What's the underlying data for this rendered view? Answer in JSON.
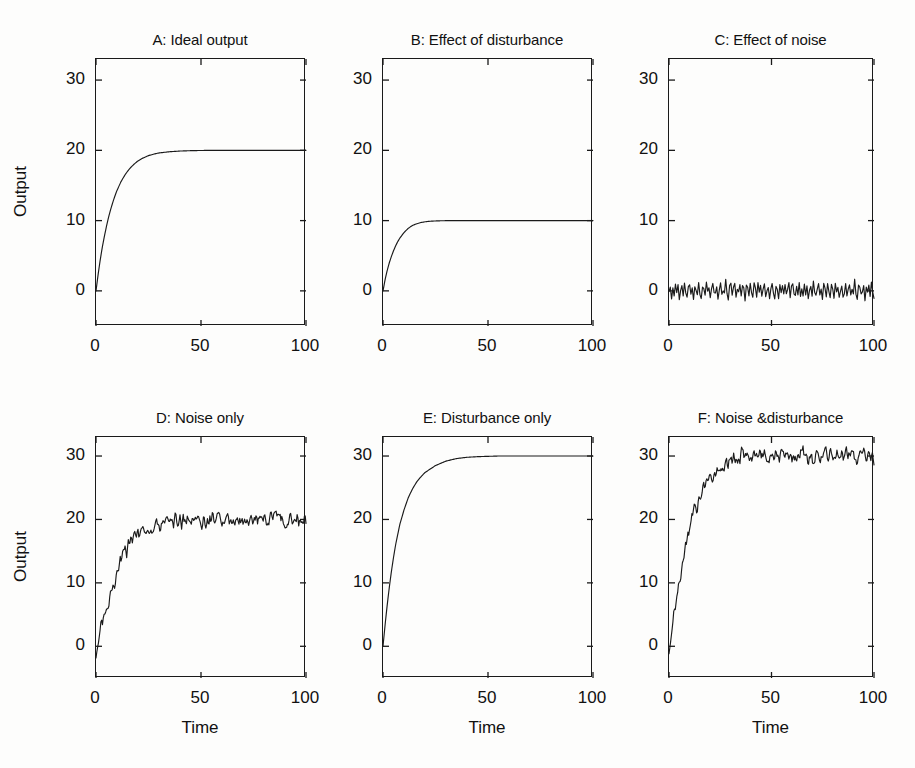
{
  "figure": {
    "background_color": "#fdfdfc",
    "line_color": "#1a1a1a",
    "axis_color": "#1a1a1a",
    "rows": 2,
    "cols": 3
  },
  "axis_common": {
    "xlabel": "Time",
    "ylabel": "Output",
    "xticks": [
      "0",
      "50",
      "100"
    ],
    "xtick_values": [
      0,
      50,
      100
    ],
    "yticks": [
      "0",
      "10",
      "20",
      "30"
    ],
    "ytick_values": [
      0,
      10,
      20,
      30
    ],
    "xlim": [
      0,
      100
    ],
    "ylim": [
      -5,
      33
    ],
    "grid": false,
    "box": true,
    "tick_direction": "in"
  },
  "panels": [
    {
      "id": "A",
      "title": "A: Ideal output",
      "show_ylabel": true,
      "show_xlabel": false,
      "row": 0,
      "col": 0
    },
    {
      "id": "B",
      "title": "B: Effect of disturbance",
      "show_ylabel": false,
      "show_xlabel": false,
      "row": 0,
      "col": 1
    },
    {
      "id": "C",
      "title": "C: Effect of noise",
      "show_ylabel": false,
      "show_xlabel": false,
      "row": 0,
      "col": 2
    },
    {
      "id": "D",
      "title": "D: Noise only",
      "show_ylabel": true,
      "show_xlabel": true,
      "row": 1,
      "col": 0
    },
    {
      "id": "E",
      "title": "E: Disturbance only",
      "show_ylabel": false,
      "show_xlabel": true,
      "row": 1,
      "col": 1
    },
    {
      "id": "F",
      "title": "F: Noise &disturbance",
      "show_ylabel": false,
      "show_xlabel": true,
      "row": 1,
      "col": 2
    }
  ],
  "chart_data": [
    {
      "type": "line",
      "panel": "A",
      "title": "A: Ideal output",
      "xlabel": "",
      "ylabel": "Output",
      "xlim": [
        0,
        100
      ],
      "ylim": [
        -5,
        33
      ],
      "xticks": [
        0,
        50,
        100
      ],
      "yticks": [
        0,
        10,
        20,
        30
      ],
      "grid": false,
      "legend": null,
      "series": [
        {
          "name": "ideal output",
          "description": "smooth first-order step response rising from 0 to steady state 20, time constant approx 10",
          "x": [
            0,
            1,
            2,
            3,
            4,
            5,
            6,
            7,
            8,
            9,
            10,
            12,
            14,
            16,
            18,
            20,
            22,
            25,
            28,
            30,
            35,
            40,
            45,
            50,
            55,
            60,
            65,
            70,
            75,
            80,
            85,
            90,
            95,
            100
          ],
          "y": [
            0,
            2.3,
            4.4,
            6.2,
            7.8,
            9.2,
            10.5,
            11.6,
            12.6,
            13.5,
            14.3,
            15.6,
            16.6,
            17.4,
            18.0,
            18.5,
            18.85,
            19.25,
            19.5,
            19.63,
            19.8,
            19.9,
            19.95,
            19.98,
            20,
            20,
            20,
            20,
            20,
            20,
            20,
            20,
            20,
            20
          ]
        }
      ]
    },
    {
      "type": "line",
      "panel": "B",
      "title": "B: Effect of disturbance",
      "xlabel": "",
      "ylabel": "",
      "xlim": [
        0,
        100
      ],
      "ylim": [
        -5,
        33
      ],
      "xticks": [
        0,
        50,
        100
      ],
      "yticks": [
        0,
        10,
        20,
        30
      ],
      "grid": false,
      "legend": null,
      "series": [
        {
          "name": "disturbance response",
          "description": "smooth first-order step response rising from 0 to steady state 10, settles by t=35",
          "x": [
            0,
            1,
            2,
            3,
            4,
            5,
            6,
            7,
            8,
            9,
            10,
            12,
            14,
            16,
            18,
            20,
            22,
            25,
            28,
            30,
            33,
            35,
            40,
            45,
            50,
            60,
            70,
            80,
            90,
            100
          ],
          "y": [
            0,
            1.6,
            2.9,
            4.0,
            4.9,
            5.7,
            6.4,
            7.0,
            7.5,
            7.9,
            8.3,
            8.9,
            9.3,
            9.55,
            9.72,
            9.83,
            9.9,
            9.95,
            9.98,
            9.99,
            10,
            10,
            10,
            10,
            10,
            10,
            10,
            10,
            10,
            10
          ]
        }
      ]
    },
    {
      "type": "line",
      "panel": "C",
      "title": "C: Effect of noise",
      "xlabel": "",
      "ylabel": "",
      "xlim": [
        0,
        100
      ],
      "ylim": [
        -5,
        33
      ],
      "xticks": [
        0,
        50,
        100
      ],
      "yticks": [
        0,
        10,
        20,
        30
      ],
      "grid": false,
      "legend": null,
      "series": [
        {
          "name": "noise",
          "description": "zero-mean random noise, amplitude roughly plus or minus 1.5",
          "mean": 0,
          "amplitude": 1.5,
          "samples": 160,
          "y": [
            -0.4,
            0.9,
            -1.1,
            0.3,
            -0.8,
            1.1,
            -0.5,
            0.6,
            -1.3,
            0.2,
            0.8,
            -0.9,
            1.2,
            -0.3,
            -1.0,
            0.5,
            1.0,
            -0.7,
            0.1,
            -1.2,
            0.9,
            0.4,
            -0.6,
            1.3,
            -0.2,
            -1.1,
            0.7,
            0.3,
            -0.9,
            1.1,
            -0.4,
            0.8,
            -1.2,
            0.2,
            1.0,
            -0.6,
            -0.1,
            0.9,
            -1.0,
            0.4,
            1.2,
            -0.8,
            0.1,
            -0.5,
            1.4,
            -0.3,
            -1.1,
            0.6,
            0.9,
            -0.7,
            0.2,
            1.1,
            -1.2,
            0.5,
            -0.4,
            0.8,
            -0.9,
            1.0,
            0.1,
            -1.3,
            0.7,
            0.3,
            -0.6,
            1.2,
            -0.2,
            -1.0,
            0.9,
            0.4,
            -0.8,
            1.1,
            -0.5,
            0.6,
            -1.1,
            0.2,
            1.3,
            -0.7,
            0.0,
            0.8,
            -1.2,
            0.5,
            1.0,
            -0.4,
            -0.9,
            0.7,
            0.3,
            -1.0,
            1.2,
            -0.3,
            0.6,
            -0.8,
            1.1,
            -0.6,
            0.2,
            0.9,
            -1.3,
            0.4,
            1.0,
            -0.5,
            -0.7,
            0.8
          ]
        }
      ]
    },
    {
      "type": "line",
      "panel": "D",
      "title": "D: Noise only",
      "xlabel": "Time",
      "ylabel": "Output",
      "xlim": [
        0,
        100
      ],
      "ylim": [
        -5,
        33
      ],
      "xticks": [
        0,
        50,
        100
      ],
      "yticks": [
        0,
        10,
        20,
        30
      ],
      "grid": false,
      "legend": null,
      "series": [
        {
          "name": "noisy output",
          "description": "noisy first-order rise starting near -2, settling around 20 with noise amplitude about plus or minus 1.5",
          "steady_state": 20,
          "start_value": -2,
          "noise_amplitude": 1.5,
          "x": [
            0,
            2,
            4,
            6,
            8,
            10,
            12,
            14,
            16,
            18,
            20,
            25,
            30,
            35,
            40,
            45,
            50,
            55,
            60,
            65,
            70,
            75,
            80,
            85,
            90,
            95,
            100
          ],
          "y": [
            -2,
            2.5,
            5.0,
            7.5,
            9.5,
            11.5,
            13.5,
            15.0,
            16.0,
            17.2,
            17.5,
            18.5,
            19.2,
            20.0,
            19.6,
            20.2,
            19.5,
            20.0,
            19.8,
            20.4,
            19.6,
            20.3,
            19.8,
            20.5,
            19.9,
            20.4,
            19.8
          ]
        }
      ]
    },
    {
      "type": "line",
      "panel": "E",
      "title": "E: Disturbance only",
      "xlabel": "Time",
      "ylabel": "",
      "xlim": [
        0,
        100
      ],
      "ylim": [
        -5,
        33
      ],
      "xticks": [
        0,
        50,
        100
      ],
      "yticks": [
        0,
        10,
        20,
        30
      ],
      "grid": false,
      "legend": null,
      "series": [
        {
          "name": "disturbance only output",
          "description": "smooth first-order step response rising from 0 to steady state 30, settles by t=55",
          "x": [
            0,
            1,
            2,
            3,
            4,
            5,
            6,
            8,
            10,
            12,
            14,
            16,
            18,
            20,
            25,
            30,
            35,
            40,
            45,
            50,
            55,
            60,
            70,
            80,
            90,
            100
          ],
          "y": [
            0,
            3.4,
            6.5,
            9.3,
            11.8,
            14.0,
            16.0,
            19.2,
            21.5,
            23.4,
            24.8,
            25.9,
            26.7,
            27.4,
            28.5,
            29.2,
            29.6,
            29.8,
            29.9,
            29.95,
            30,
            30,
            30,
            30,
            30,
            30
          ]
        }
      ]
    },
    {
      "type": "line",
      "panel": "F",
      "title": "F: Noise &disturbance",
      "xlabel": "Time",
      "ylabel": "",
      "xlim": [
        0,
        100
      ],
      "ylim": [
        -5,
        33
      ],
      "xticks": [
        0,
        50,
        100
      ],
      "yticks": [
        0,
        10,
        20,
        30
      ],
      "grid": false,
      "legend": null,
      "series": [
        {
          "name": "noise and disturbance output",
          "description": "noisy first-order rise starting near -1, settling around 30 with noise amplitude about plus or minus 1.5",
          "steady_state": 30,
          "start_value": -1,
          "noise_amplitude": 1.5,
          "x": [
            0,
            2,
            4,
            6,
            8,
            10,
            12,
            14,
            16,
            18,
            20,
            25,
            30,
            35,
            40,
            45,
            50,
            55,
            60,
            65,
            70,
            75,
            80,
            85,
            90,
            95,
            100
          ],
          "y": [
            -1,
            4.0,
            8.0,
            12.0,
            15.5,
            18.5,
            21.0,
            22.0,
            24.5,
            26.2,
            26.5,
            27.5,
            29.0,
            30.3,
            29.5,
            30.2,
            29.6,
            30.4,
            29.8,
            30.6,
            29.7,
            30.4,
            29.9,
            30.8,
            29.6,
            30.5,
            29.8
          ]
        }
      ]
    }
  ]
}
